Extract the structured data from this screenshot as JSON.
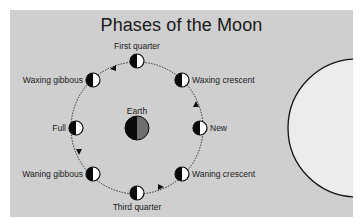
{
  "diagram": {
    "title": "Phases of the Moon",
    "center_label": "Earth",
    "phases": [
      {
        "name": "New",
        "position": "right"
      },
      {
        "name": "Waxing crescent",
        "position": "upper-right"
      },
      {
        "name": "First quarter",
        "position": "top"
      },
      {
        "name": "Waxing gibbous",
        "position": "upper-left"
      },
      {
        "name": "Full",
        "position": "left"
      },
      {
        "name": "Waning gibbous",
        "position": "lower-left"
      },
      {
        "name": "Third quarter",
        "position": "bottom"
      },
      {
        "name": "Waning crescent",
        "position": "lower-right"
      }
    ],
    "orbit_direction": "counterclockwise",
    "sun": "large circle at right edge (light source)",
    "colors": {
      "background": "#cfcfcf",
      "sun_fill": "#ececec",
      "moon_dark": "#0a0a0a",
      "moon_light": "#ffffff",
      "earth_dark": "#0a0a0a",
      "earth_shade": "#6e6e6e"
    }
  }
}
